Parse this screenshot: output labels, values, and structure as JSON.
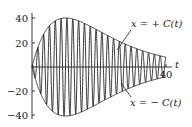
{
  "chart_data": {
    "type": "line",
    "title": "",
    "xlabel": "t",
    "ylabel": "",
    "xlim": [
      0,
      40
    ],
    "ylim": [
      -40,
      40
    ],
    "x_ticks": [
      {
        "value": 40,
        "label": "40"
      }
    ],
    "y_ticks": [
      {
        "value": 40,
        "label": "40"
      },
      {
        "value": 20,
        "label": "20"
      },
      {
        "value": -20,
        "label": "−20"
      },
      {
        "value": -40,
        "label": "−40"
      }
    ],
    "grid": false,
    "series": [
      {
        "name": "x = + C(t)",
        "kind": "envelope",
        "formula": "C(t) = 40*(t/10)*exp(1 - t/10)",
        "x": [
          0,
          5,
          10,
          15,
          20,
          25,
          30,
          35,
          40
        ],
        "values": [
          0,
          32.4,
          40,
          36.4,
          29.4,
          22.3,
          16.2,
          11.5,
          8.0
        ]
      },
      {
        "name": "x = − C(t)",
        "kind": "envelope",
        "x": [
          0,
          5,
          10,
          15,
          20,
          25,
          30,
          35,
          40
        ],
        "values": [
          0,
          -32.4,
          -40,
          -36.4,
          -29.4,
          -22.3,
          -16.2,
          -11.5,
          -8.0
        ]
      },
      {
        "name": "x(t)",
        "kind": "oscillation",
        "formula": "C(t)*cos(2*pi*t/1.75)",
        "cycles": 23
      }
    ],
    "annotations": [
      {
        "text": "x = + C(t)",
        "points_to": "upper envelope"
      },
      {
        "text": "x = − C(t)",
        "points_to": "lower envelope"
      }
    ]
  },
  "labels": {
    "axis_t": "t",
    "tick_40x": "40",
    "y40": "40",
    "y20": "20",
    "yn20": "−20",
    "yn40": "−40",
    "upper": "x = + C(t)",
    "lower": "x = − C(t)"
  },
  "colors": {
    "ink": "#222222",
    "background": "#ffffff"
  }
}
